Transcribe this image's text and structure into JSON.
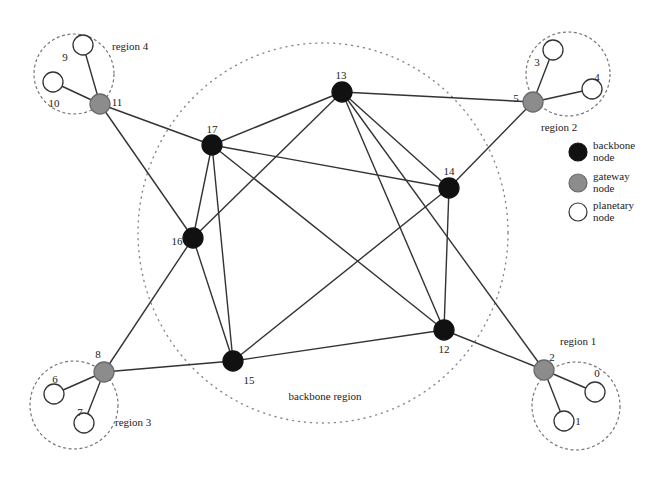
{
  "diagram": {
    "backbone_region": {
      "label": "backbone region",
      "cx": 323,
      "cy": 233,
      "rx": 185,
      "ry": 190,
      "label_x": 325,
      "label_y": 400
    },
    "regions": [
      {
        "id": "region-1",
        "label": "region 1",
        "cx": 576,
        "cy": 406,
        "r": 44,
        "label_x": 560,
        "label_y": 345
      },
      {
        "id": "region-2",
        "label": "region 2",
        "cx": 568,
        "cy": 74,
        "r": 42,
        "label_x": 541,
        "label_y": 131
      },
      {
        "id": "region-3",
        "label": "region 3",
        "cx": 74,
        "cy": 405,
        "r": 44,
        "label_x": 115,
        "label_y": 426
      },
      {
        "id": "region-4",
        "label": "region 4",
        "cx": 74,
        "cy": 74,
        "r": 40,
        "label_x": 112,
        "label_y": 50
      }
    ],
    "node_types": {
      "backbone": {
        "fill": "#111111",
        "stroke": "#111111",
        "r": 10
      },
      "gateway": {
        "fill": "#8c8c8c",
        "stroke": "#6a6a6a",
        "r": 10
      },
      "planetary": {
        "fill": "#ffffff",
        "stroke": "#333333",
        "r": 10
      }
    },
    "nodes": [
      {
        "id": "0",
        "label": "0",
        "type": "planetary",
        "x": 595,
        "y": 392,
        "lx": 597,
        "ly": 374
      },
      {
        "id": "1",
        "label": "1",
        "type": "planetary",
        "x": 564,
        "y": 421,
        "lx": 578,
        "ly": 422
      },
      {
        "id": "2",
        "label": "2",
        "type": "gateway",
        "x": 544,
        "y": 370,
        "lx": 552,
        "ly": 358
      },
      {
        "id": "3",
        "label": "3",
        "type": "planetary",
        "x": 553,
        "y": 50,
        "lx": 537,
        "ly": 63
      },
      {
        "id": "4",
        "label": "4",
        "type": "planetary",
        "x": 592,
        "y": 89,
        "lx": 597,
        "ly": 78
      },
      {
        "id": "5",
        "label": "5",
        "type": "gateway",
        "x": 533,
        "y": 102,
        "lx": 516,
        "ly": 99
      },
      {
        "id": "6",
        "label": "6",
        "type": "planetary",
        "x": 54,
        "y": 394,
        "lx": 55,
        "ly": 380
      },
      {
        "id": "7",
        "label": "7",
        "type": "planetary",
        "x": 84,
        "y": 423,
        "lx": 80,
        "ly": 413
      },
      {
        "id": "8",
        "label": "8",
        "type": "gateway",
        "x": 104,
        "y": 372,
        "lx": 98,
        "ly": 355
      },
      {
        "id": "9",
        "label": "9",
        "type": "planetary",
        "x": 83,
        "y": 45,
        "lx": 65,
        "ly": 58
      },
      {
        "id": "10",
        "label": "10",
        "type": "planetary",
        "x": 53,
        "y": 82,
        "lx": 54,
        "ly": 104
      },
      {
        "id": "11",
        "label": "11",
        "type": "gateway",
        "x": 100,
        "y": 104,
        "lx": 117,
        "ly": 103
      },
      {
        "id": "12",
        "label": "12",
        "type": "backbone",
        "x": 444,
        "y": 330,
        "lx": 444,
        "ly": 350
      },
      {
        "id": "13",
        "label": "13",
        "type": "backbone",
        "x": 342,
        "y": 92,
        "lx": 341,
        "ly": 76
      },
      {
        "id": "14",
        "label": "14",
        "type": "backbone",
        "x": 449,
        "y": 188,
        "lx": 449,
        "ly": 172
      },
      {
        "id": "15",
        "label": "15",
        "type": "backbone",
        "x": 233,
        "y": 361,
        "lx": 249,
        "ly": 381
      },
      {
        "id": "16",
        "label": "16",
        "type": "backbone",
        "x": 193,
        "y": 238,
        "lx": 177,
        "ly": 242
      },
      {
        "id": "17",
        "label": "17",
        "type": "backbone",
        "x": 212,
        "y": 145,
        "lx": 212,
        "ly": 130
      }
    ],
    "edges": [
      [
        "11",
        "10"
      ],
      [
        "11",
        "9"
      ],
      [
        "11",
        "17"
      ],
      [
        "11",
        "16"
      ],
      [
        "5",
        "3"
      ],
      [
        "5",
        "4"
      ],
      [
        "5",
        "13"
      ],
      [
        "5",
        "14"
      ],
      [
        "8",
        "6"
      ],
      [
        "8",
        "7"
      ],
      [
        "8",
        "16"
      ],
      [
        "8",
        "15"
      ],
      [
        "2",
        "0"
      ],
      [
        "2",
        "1"
      ],
      [
        "2",
        "12"
      ],
      [
        "2",
        "13"
      ],
      [
        "13",
        "17"
      ],
      [
        "13",
        "16"
      ],
      [
        "13",
        "14"
      ],
      [
        "13",
        "12"
      ],
      [
        "17",
        "16"
      ],
      [
        "17",
        "15"
      ],
      [
        "17",
        "14"
      ],
      [
        "17",
        "12"
      ],
      [
        "16",
        "15"
      ],
      [
        "14",
        "15"
      ],
      [
        "14",
        "12"
      ],
      [
        "15",
        "12"
      ]
    ]
  },
  "legend": {
    "items": [
      {
        "type": "backbone",
        "line1": "backbone",
        "line2": "node",
        "y": 152
      },
      {
        "type": "gateway",
        "line1": "gateway",
        "line2": "node",
        "y": 183
      },
      {
        "type": "planetary",
        "line1": "planetary",
        "line2": "node",
        "y": 212
      }
    ],
    "x": 578
  }
}
